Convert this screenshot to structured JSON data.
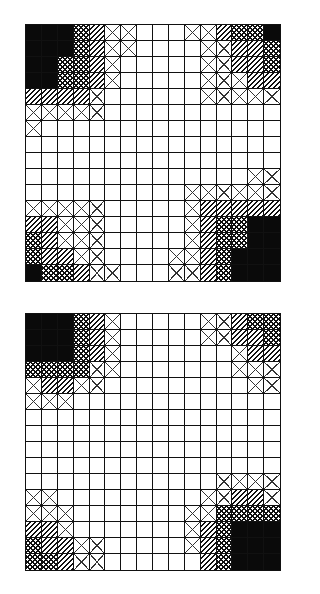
{
  "legend_codes": {
    "B": "solid-black",
    "C": "crosshatch",
    "D": "diagonal-hatch",
    "X": "x-cross",
    ".": "empty"
  },
  "colors": {
    "line": "#111111",
    "fill_black": "#0a0a0a",
    "background": "#ffffff"
  },
  "grids": [
    {
      "name": "top-grid",
      "rows": 16,
      "cols": 16,
      "cells": [
        "BBBCDXX...XXDCCB",
        "BBBCDXX....XXDDC",
        "BBCCDX.....XXDDC",
        "BBCCDX.....XXXDD",
        "DDDDX......XXXXX",
        "XXXXX...........",
        "X...............",
        "................",
        "................",
        "..............XX",
        "..........XXXXXX",
        "XXXXX.....XDDDDD",
        "DDXXX.....XDCCBB",
        "CDXXX.....XDCCBB",
        "CDDXX....XXDCBBB",
        "BCCDXX...XXDCBBB"
      ]
    },
    {
      "name": "bottom-grid",
      "rows": 16,
      "cols": 16,
      "cells": [
        "BBBCDX.....XXDCC",
        "BBBCDX.....XXDDC",
        "BBBCDX.......XDD",
        "CCCCXX.......XXX",
        "XDDXX.........XX",
        "XXX.............",
        "................",
        "................",
        "................",
        "................",
        "............XXXX",
        "XX.........XXDDX",
        "XXX.......XXCCCC",
        "DDX.......XDCBBB",
        "CDDXX.....XDCBBB",
        "CCDXX......DCBBB"
      ]
    }
  ]
}
